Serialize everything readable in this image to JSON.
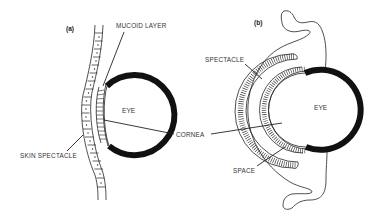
{
  "figure": {
    "panels": [
      {
        "id": "a",
        "label": "(a)",
        "labels": {
          "mucoid_layer": "MUCOID LAYER",
          "eye": "EYE",
          "skin_spectacle": "SKIN SPECTACLE"
        }
      },
      {
        "id": "b",
        "label": "(b)",
        "labels": {
          "spectacle": "SPECTACLE",
          "eye": "EYE",
          "space": "SPACE"
        }
      }
    ],
    "shared_labels": {
      "cornea": "CORNEA"
    },
    "colors": {
      "line": "#222222",
      "eye_wall": "#111111",
      "background": "#ffffff"
    }
  }
}
